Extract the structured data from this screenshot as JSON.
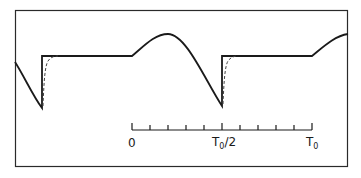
{
  "figure": {
    "frame": {
      "x": 15,
      "y": 10,
      "width": 333,
      "height": 157,
      "stroke": "#2a2a2a"
    },
    "waveform": {
      "description": "Periodic waveform with sinusoidal hump followed by sharp vertical reset and flat plateau; dashed curve shows smoothed reset",
      "solid_color": "#1a1a1a",
      "dashed_color": "#444444"
    },
    "time_axis": {
      "x_start": 132,
      "x_end": 312,
      "y": 126,
      "tick_count": 11,
      "labels": [
        {
          "id": "zero",
          "text": "0",
          "sub": "",
          "suffix": ""
        },
        {
          "id": "half",
          "text": "T",
          "sub": "0",
          "suffix": "/2"
        },
        {
          "id": "full",
          "text": "T",
          "sub": "0",
          "suffix": ""
        }
      ]
    }
  }
}
